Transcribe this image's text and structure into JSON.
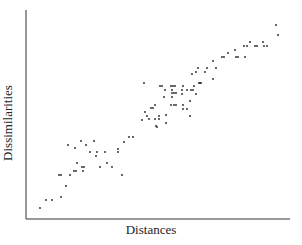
{
  "chart_data": {
    "type": "scatter",
    "title": "",
    "xlabel": "Distances",
    "ylabel": "Dissimilarities",
    "grid": false,
    "legend": null,
    "ticks": false,
    "axis_pixels": {
      "x0": 26,
      "x1": 290,
      "y0": 219,
      "y1": 10
    },
    "points_px": [
      [
        40,
        208
      ],
      [
        46,
        200
      ],
      [
        52,
        200
      ],
      [
        61,
        197
      ],
      [
        66,
        186
      ],
      [
        59,
        175
      ],
      [
        61,
        175
      ],
      [
        70,
        175
      ],
      [
        74,
        171
      ],
      [
        76,
        171
      ],
      [
        77,
        163
      ],
      [
        68,
        145
      ],
      [
        75,
        148
      ],
      [
        81,
        141
      ],
      [
        86,
        145
      ],
      [
        94,
        141
      ],
      [
        90,
        152
      ],
      [
        96,
        156
      ],
      [
        97,
        152
      ],
      [
        84,
        167
      ],
      [
        82,
        167
      ],
      [
        83,
        171
      ],
      [
        100,
        167
      ],
      [
        107,
        163
      ],
      [
        105,
        152
      ],
      [
        112,
        167
      ],
      [
        118,
        149
      ],
      [
        118,
        152
      ],
      [
        122,
        175
      ],
      [
        124,
        142
      ],
      [
        129,
        137
      ],
      [
        133,
        137
      ],
      [
        144,
        83
      ],
      [
        142,
        120
      ],
      [
        145,
        112
      ],
      [
        147,
        116
      ],
      [
        149,
        119
      ],
      [
        151,
        108
      ],
      [
        153,
        108
      ],
      [
        155,
        105
      ],
      [
        155,
        119
      ],
      [
        156,
        126
      ],
      [
        157,
        127
      ],
      [
        159,
        116
      ],
      [
        159,
        119
      ],
      [
        160,
        86
      ],
      [
        162,
        86
      ],
      [
        164,
        97
      ],
      [
        165,
        90
      ],
      [
        166,
        115
      ],
      [
        166,
        123
      ],
      [
        171,
        86
      ],
      [
        173,
        86
      ],
      [
        175,
        86
      ],
      [
        172,
        90
      ],
      [
        172,
        93
      ],
      [
        174,
        93
      ],
      [
        176,
        93
      ],
      [
        172,
        97
      ],
      [
        171,
        105
      ],
      [
        174,
        105
      ],
      [
        176,
        105
      ],
      [
        183,
        86
      ],
      [
        182,
        90
      ],
      [
        182,
        94
      ],
      [
        183,
        105
      ],
      [
        183,
        109
      ],
      [
        187,
        90
      ],
      [
        187,
        109
      ],
      [
        190,
        116
      ],
      [
        191,
        90
      ],
      [
        190,
        101
      ],
      [
        192,
        74
      ],
      [
        193,
        90
      ],
      [
        194,
        86
      ],
      [
        196,
        94
      ],
      [
        196,
        72
      ],
      [
        198,
        68
      ],
      [
        199,
        83
      ],
      [
        200,
        83
      ],
      [
        201,
        83
      ],
      [
        205,
        72
      ],
      [
        207,
        68
      ],
      [
        213,
        79
      ],
      [
        216,
        68
      ],
      [
        213,
        61
      ],
      [
        222,
        57
      ],
      [
        224,
        57
      ],
      [
        228,
        53
      ],
      [
        235,
        50
      ],
      [
        236,
        57
      ],
      [
        238,
        57
      ],
      [
        244,
        46
      ],
      [
        245,
        57
      ],
      [
        247,
        46
      ],
      [
        250,
        42
      ],
      [
        255,
        46
      ],
      [
        257,
        46
      ],
      [
        263,
        42
      ],
      [
        264,
        46
      ],
      [
        267,
        46
      ],
      [
        276,
        25
      ],
      [
        278,
        35
      ]
    ]
  }
}
